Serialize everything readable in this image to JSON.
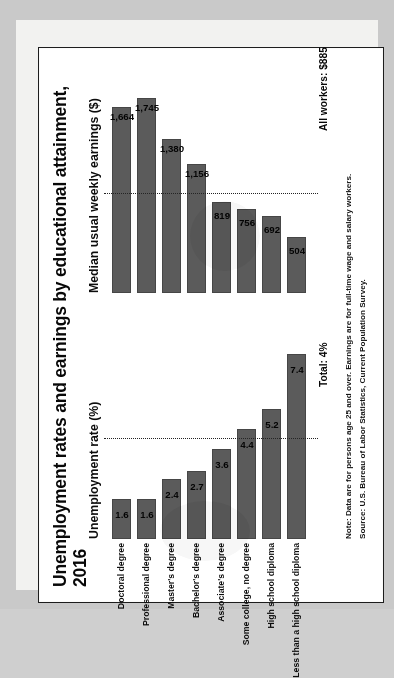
{
  "figure": {
    "title": "Unemployment rates and earnings by educational attainment, 2016",
    "note": "Note: Data are for persons age 25 and over. Earnings are for full-time wage and salary workers.",
    "source": "Source: U.S. Bureau of Labor Statistics, Current Population Survey.",
    "bar_color": "#5e5e5e",
    "background_color": "#fbfbfa",
    "orientation": "rotated-90-ccw"
  },
  "chart_data": {
    "type": "bar",
    "title": "Unemployment rates and earnings by educational attainment, 2016",
    "categories": [
      "Doctoral degree",
      "Professional degree",
      "Master's degree",
      "Bachelor's degree",
      "Associate's degree",
      "Some college, no degree",
      "High school diploma",
      "Less than a high school diploma"
    ],
    "panels": [
      {
        "name": "unemployment",
        "axis_label": "Unemployment rate (%)",
        "values": [
          1.6,
          1.6,
          2.4,
          2.7,
          3.6,
          4.4,
          5.2,
          7.4
        ],
        "value_labels": [
          "1.6",
          "1.6",
          "2.4",
          "2.7",
          "3.6",
          "4.4",
          "5.2",
          "7.4"
        ],
        "reference_line": {
          "label": "Total: 4%",
          "value": 4.0
        },
        "xlim": [
          0,
          8
        ],
        "grid": false
      },
      {
        "name": "earnings",
        "axis_label": "Median usual weekly earnings ($)",
        "values": [
          1664,
          1745,
          1380,
          1156,
          819,
          756,
          692,
          504
        ],
        "value_labels": [
          "1,664",
          "1,745",
          "1,380",
          "1,156",
          "819",
          "756",
          "692",
          "504"
        ],
        "reference_line": {
          "label": "All workers: $885",
          "value": 885
        },
        "xlim": [
          0,
          1900
        ],
        "grid": false
      }
    ],
    "xlabel": "",
    "ylabel": "",
    "legend": null,
    "annotations": [
      "Note: Data are for persons age 25 and over. Earnings are for full-time wage and salary workers.",
      "Source: U.S. Bureau of Labor Statistics, Current Population Survey."
    ]
  }
}
